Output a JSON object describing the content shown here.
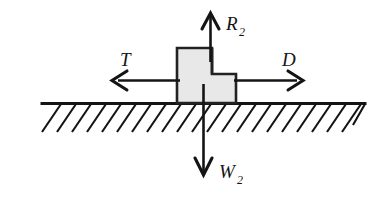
{
  "figure": {
    "name": "free-body-diagram",
    "background_color": "#ffffff",
    "stroke_color": "#141414",
    "block_fill_color": "#e8e8e8",
    "block_stroke_color": "#222222"
  },
  "forces": {
    "reaction": {
      "symbol": "R",
      "subscript": "2",
      "direction": "up",
      "arrow_name": "reaction-force-arrow"
    },
    "tension": {
      "symbol": "T",
      "subscript": "",
      "direction": "left",
      "arrow_name": "tension-force-arrow"
    },
    "drag": {
      "symbol": "D",
      "subscript": "",
      "direction": "right",
      "arrow_name": "drag-force-arrow"
    },
    "weight": {
      "symbol": "W",
      "subscript": "2",
      "direction": "down",
      "arrow_name": "weight-force-arrow"
    }
  },
  "ground": {
    "label": "hatched-ground-surface",
    "hatch_count": 22
  },
  "body": {
    "label": "stepped-block"
  }
}
